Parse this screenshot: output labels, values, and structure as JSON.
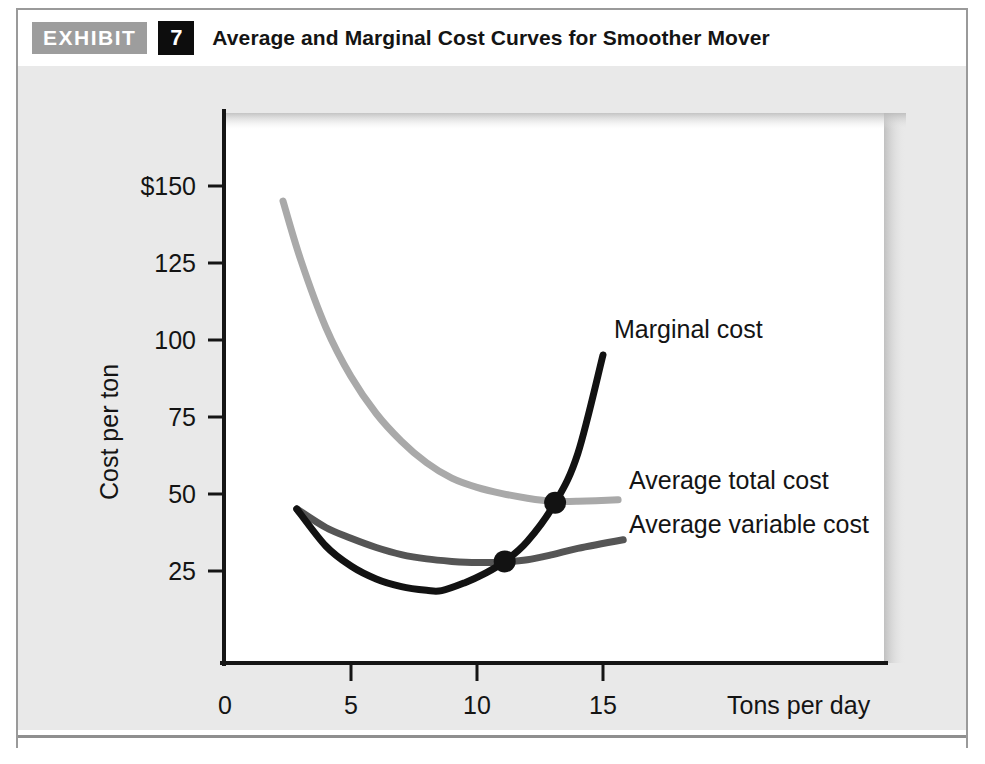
{
  "header": {
    "exhibit_label": "EXHIBIT",
    "exhibit_number": "7",
    "title": "Average and Marginal Cost Curves for Smoother Mover"
  },
  "chart_data": {
    "type": "line",
    "title": "Average and Marginal Cost Curves for Smoother Mover",
    "xlabel": "Tons per day",
    "ylabel": "Cost per ton",
    "xlim": [
      0,
      17.5
    ],
    "ylim": [
      0,
      172
    ],
    "grid": false,
    "legend_position": "inline-right-of-curves",
    "x_ticks": [
      "0",
      "5",
      "10",
      "15"
    ],
    "x_tick_values": [
      0,
      5,
      10,
      15
    ],
    "y_ticks": [
      "25",
      "50",
      "75",
      "100",
      "125",
      "$150"
    ],
    "y_tick_values": [
      25,
      50,
      75,
      100,
      125,
      150
    ],
    "series": [
      {
        "name": "Average total cost",
        "color": "#a9a9a9",
        "label": "Average total cost",
        "x": [
          2.3,
          3.0,
          4.0,
          5.0,
          6.0,
          7.0,
          8.0,
          9.0,
          10.0,
          11.0,
          12.0,
          13.0,
          14.0,
          15.6
        ],
        "values": [
          150,
          131,
          109,
          93,
          81,
          72,
          65,
          60,
          57,
          55,
          53.5,
          52.5,
          52.5,
          53
        ]
      },
      {
        "name": "Average variable cost",
        "color": "#555555",
        "label": "Average variable cost",
        "x": [
          2.85,
          4.0,
          5.0,
          6.0,
          7.0,
          8.0,
          9.0,
          10.0,
          11.1,
          12.0,
          13.0,
          14.0,
          15.8
        ],
        "values": [
          50,
          44,
          40.5,
          37.5,
          35.2,
          33.8,
          33.0,
          32.6,
          32.8,
          33.5,
          35.2,
          37.2,
          40
        ]
      },
      {
        "name": "Marginal cost",
        "color": "#121212",
        "label": "Marginal cost",
        "x": [
          2.85,
          4.0,
          5.0,
          6.0,
          7.0,
          8.0,
          8.6,
          9.5,
          10.3,
          11.1,
          12.0,
          13.1,
          14.0,
          15.0
        ],
        "values": [
          50,
          38,
          31.5,
          27.3,
          24.8,
          23.6,
          23.5,
          26,
          29,
          33,
          39.5,
          52,
          68,
          100
        ]
      }
    ],
    "annotations": [
      {
        "name": "mc-crosses-avc",
        "x": 11.1,
        "y": 33,
        "marker": "dot",
        "color": "#121212",
        "note": "Marginal cost intersects average variable cost at its minimum"
      },
      {
        "name": "mc-crosses-atc",
        "x": 13.1,
        "y": 52,
        "marker": "dot",
        "color": "#121212",
        "note": "Marginal cost intersects average total cost at its minimum"
      }
    ]
  }
}
